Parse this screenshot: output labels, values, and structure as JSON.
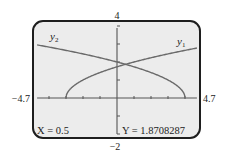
{
  "chart_data": {
    "type": "line",
    "title": "",
    "xlabel": "",
    "ylabel": "",
    "xlim": [
      -4.7,
      4.7
    ],
    "ylim": [
      -2,
      4
    ],
    "xscl": 1,
    "yscl": 1,
    "grid": false,
    "window_labels": {
      "xmin": "−4.7",
      "xmax": "4.7",
      "ymin": "−2",
      "ymax": "4"
    },
    "series": [
      {
        "name": "y1",
        "label": "y",
        "subscript": "1",
        "expression": "sqrt(x+3)",
        "domain": [
          -3,
          4.7
        ]
      },
      {
        "name": "y2",
        "label": "y",
        "subscript": "2",
        "expression": "sqrt(4-x)",
        "domain": [
          -4.7,
          4
        ]
      }
    ],
    "trace": {
      "x_label": "X = 0.5",
      "y_label": "Y = 1.8708287",
      "x": 0.5,
      "y": 1.8708287
    }
  },
  "colors": {
    "screen_bg": "#ececec",
    "frame": "#1e1e1e",
    "curve": "#6a6a6a",
    "axis": "#555555",
    "text": "#222222"
  }
}
